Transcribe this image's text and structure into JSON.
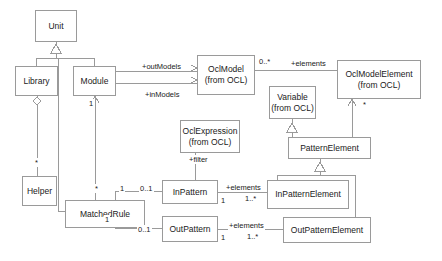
{
  "diagram": {
    "type": "uml-class-diagram",
    "background": "#ffffff",
    "line_color": "#9a9a9a",
    "text_color": "#1a1a1a"
  },
  "classes": [
    {
      "id": "unit",
      "name": "Unit",
      "package": "",
      "x": 35,
      "y": 10,
      "w": 42,
      "h": 32
    },
    {
      "id": "library",
      "name": "Library",
      "package": "",
      "x": 15,
      "y": 66,
      "w": 43,
      "h": 30
    },
    {
      "id": "module",
      "name": "Module",
      "package": "",
      "x": 73,
      "y": 66,
      "w": 43,
      "h": 30
    },
    {
      "id": "oclmodel",
      "name": "OclModel",
      "package": "(from OCL)",
      "x": 197,
      "y": 55,
      "w": 58,
      "h": 40
    },
    {
      "id": "oclmodelelement",
      "name": "OclModelElement",
      "package": "(from OCL)",
      "x": 337,
      "y": 60,
      "w": 84,
      "h": 39
    },
    {
      "id": "variable",
      "name": "Variable",
      "package": "(from OCL)",
      "x": 269,
      "y": 86,
      "w": 47,
      "h": 33
    },
    {
      "id": "oclexpression",
      "name": "OclExpression",
      "package": "(from OCL)",
      "x": 180,
      "y": 120,
      "w": 60,
      "h": 33
    },
    {
      "id": "patternelement",
      "name": "PatternElement",
      "package": "",
      "x": 288,
      "y": 137,
      "w": 83,
      "h": 22
    },
    {
      "id": "helper",
      "name": "Helper",
      "package": "",
      "x": 22,
      "y": 176,
      "w": 35,
      "h": 30
    },
    {
      "id": "inpattern",
      "name": "InPattern",
      "package": "",
      "x": 162,
      "y": 180,
      "w": 56,
      "h": 24
    },
    {
      "id": "inpatternelement",
      "name": "InPatternElement",
      "package": "",
      "x": 267,
      "y": 180,
      "w": 82,
      "h": 29
    },
    {
      "id": "matchedrule",
      "name": "MatchedRule",
      "package": "",
      "x": 65,
      "y": 200,
      "w": 80,
      "h": 28
    },
    {
      "id": "outpattern",
      "name": "OutPattern",
      "package": "",
      "x": 162,
      "y": 216,
      "w": 56,
      "h": 26
    },
    {
      "id": "outpatternelement",
      "name": "OutPatternElement",
      "package": "",
      "x": 283,
      "y": 217,
      "w": 88,
      "h": 26
    }
  ],
  "role_labels": [
    {
      "id": "outmodels",
      "text": "+outModels",
      "x": 141,
      "y": 62
    },
    {
      "id": "inmodels",
      "text": "+inModels",
      "x": 144,
      "y": 90
    },
    {
      "id": "elements1",
      "text": "+elements",
      "x": 290,
      "y": 59
    },
    {
      "id": "filter",
      "text": "+filter",
      "x": 188,
      "y": 155
    },
    {
      "id": "elements2",
      "text": "+elements",
      "x": 225,
      "y": 183
    },
    {
      "id": "elements3",
      "text": "+elements",
      "x": 228,
      "y": 221
    }
  ],
  "multiplicities": [
    {
      "id": "module-unit-1",
      "text": "1",
      "x": 88,
      "y": 99
    },
    {
      "id": "oclmodel-star",
      "text": "0..*",
      "x": 258,
      "y": 57
    },
    {
      "id": "ocelem-star",
      "text": "*",
      "x": 362,
      "y": 100
    },
    {
      "id": "library-helper-star",
      "text": "*",
      "x": 34,
      "y": 158
    },
    {
      "id": "matched-star",
      "text": "*",
      "x": 94,
      "y": 184
    },
    {
      "id": "matched-in-1",
      "text": "1",
      "x": 119,
      "y": 184
    },
    {
      "id": "inpattern-01",
      "text": "0..1",
      "x": 139,
      "y": 184
    },
    {
      "id": "matched-out-1",
      "text": "1",
      "x": 104,
      "y": 215
    },
    {
      "id": "outpattern-01",
      "text": "0..1",
      "x": 137,
      "y": 225
    },
    {
      "id": "inpattern-1",
      "text": "1",
      "x": 220,
      "y": 196
    },
    {
      "id": "inelem-1star",
      "text": "1..*",
      "x": 244,
      "y": 194
    },
    {
      "id": "outpattern-1",
      "text": "1",
      "x": 220,
      "y": 233
    },
    {
      "id": "outelem-1star",
      "text": "1..*",
      "x": 246,
      "y": 232
    }
  ]
}
